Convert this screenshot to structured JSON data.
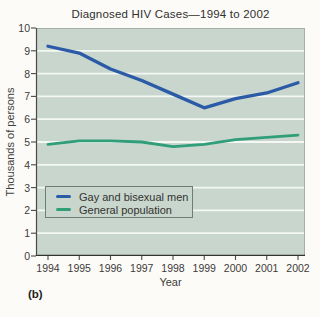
{
  "figure_label": "(b)",
  "chart_data": {
    "type": "line",
    "title": "Diagnosed HIV Cases—1994 to 2002",
    "xlabel": "Year",
    "ylabel": "Thousands of persons",
    "x": [
      1994,
      1995,
      1996,
      1997,
      1998,
      1999,
      2000,
      2001,
      2002
    ],
    "ylim": [
      0,
      10
    ],
    "ytick_step": 1,
    "grid": true,
    "legend_position": "lower-left",
    "series": [
      {
        "name": "Gay and bisexual men",
        "color": "#2b5aa6",
        "values": [
          9.2,
          8.9,
          8.2,
          7.7,
          7.1,
          6.5,
          6.9,
          7.15,
          7.6
        ]
      },
      {
        "name": "General population",
        "color": "#2f9e79",
        "values": [
          4.9,
          5.05,
          5.05,
          5.0,
          4.8,
          4.9,
          5.1,
          5.2,
          5.3
        ]
      }
    ],
    "colors": {
      "plot_background": "#c8d6ce",
      "gridline": "#f4f7f4",
      "axis_line": "#4a4a46",
      "frame_border": "#a3afa8"
    }
  }
}
